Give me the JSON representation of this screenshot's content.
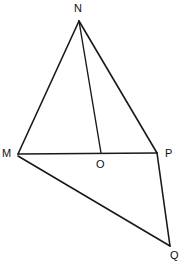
{
  "figure": {
    "kind": "geometry-diagram",
    "background_color": "#ffffff",
    "stroke_color": "#1a1a1a",
    "label_color": "#111111",
    "canvas": {
      "width": 188,
      "height": 268
    },
    "points": [
      {
        "id": "N",
        "label": "N",
        "x": 79,
        "y": 21,
        "label_x": 74,
        "label_y": 3
      },
      {
        "id": "M",
        "label": "M",
        "x": 18,
        "y": 154,
        "label_x": 2,
        "label_y": 148
      },
      {
        "id": "O",
        "label": "O",
        "x": 101,
        "y": 153,
        "label_x": 96,
        "label_y": 159
      },
      {
        "id": "P",
        "label": "P",
        "x": 157,
        "y": 153,
        "label_x": 165,
        "label_y": 148
      },
      {
        "id": "Q",
        "label": "Q",
        "x": 170,
        "y": 246,
        "label_x": 170,
        "label_y": 250
      }
    ],
    "segments": [
      {
        "id": "MN",
        "from": "M",
        "to": "N",
        "x1": 18,
        "y1": 154,
        "x2": 79,
        "y2": 21
      },
      {
        "id": "NP",
        "from": "N",
        "to": "P",
        "x1": 79,
        "y1": 21,
        "x2": 157,
        "y2": 153
      },
      {
        "id": "MP",
        "from": "M",
        "to": "P",
        "x1": 18,
        "y1": 154,
        "x2": 157,
        "y2": 153
      },
      {
        "id": "NO",
        "from": "N",
        "to": "O",
        "x1": 79,
        "y1": 21,
        "x2": 101,
        "y2": 153
      },
      {
        "id": "MQ",
        "from": "M",
        "to": "Q",
        "x1": 18,
        "y1": 156,
        "x2": 170,
        "y2": 246
      },
      {
        "id": "PQ",
        "from": "P",
        "to": "Q",
        "x1": 157,
        "y1": 153,
        "x2": 170,
        "y2": 246
      }
    ]
  }
}
